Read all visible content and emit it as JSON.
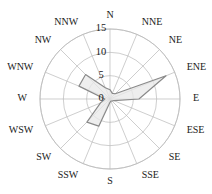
{
  "chart_data": {
    "type": "radar",
    "title": "",
    "subtitle": "",
    "xlabel": "",
    "ylabel": "",
    "grid": true,
    "legend": "none",
    "center": {
      "x": 110,
      "y": 99
    },
    "max_radius_px": 70,
    "rlim": [
      0,
      15
    ],
    "radial_ticks": [
      0,
      5,
      10,
      15
    ],
    "radial_tick_labels": [
      "0",
      "5",
      "10",
      "15"
    ],
    "categories": [
      "N",
      "NNE",
      "NE",
      "ENE",
      "E",
      "ESE",
      "SE",
      "SSE",
      "S",
      "SSW",
      "SW",
      "WSW",
      "W",
      "WNW",
      "NW",
      "NNW"
    ],
    "values": [
      2.0,
      1.3,
      1.6,
      13.0,
      6.2,
      0.9,
      0.6,
      0.5,
      0.7,
      6.3,
      7.0,
      2.2,
      1.1,
      7.2,
      7.4,
      2.6
    ],
    "series": [
      {
        "name": "wind-frequency",
        "values": [
          2.0,
          1.3,
          1.6,
          13.0,
          6.2,
          0.9,
          0.6,
          0.5,
          0.7,
          6.3,
          7.0,
          2.2,
          1.1,
          7.2,
          7.4,
          2.6
        ]
      }
    ],
    "colors": {
      "fill": "#e8e8e8",
      "stroke": "#8a8a8a",
      "grid": "#b9b9b9",
      "text": "#1a1a1a",
      "background": "#ffffff"
    }
  }
}
